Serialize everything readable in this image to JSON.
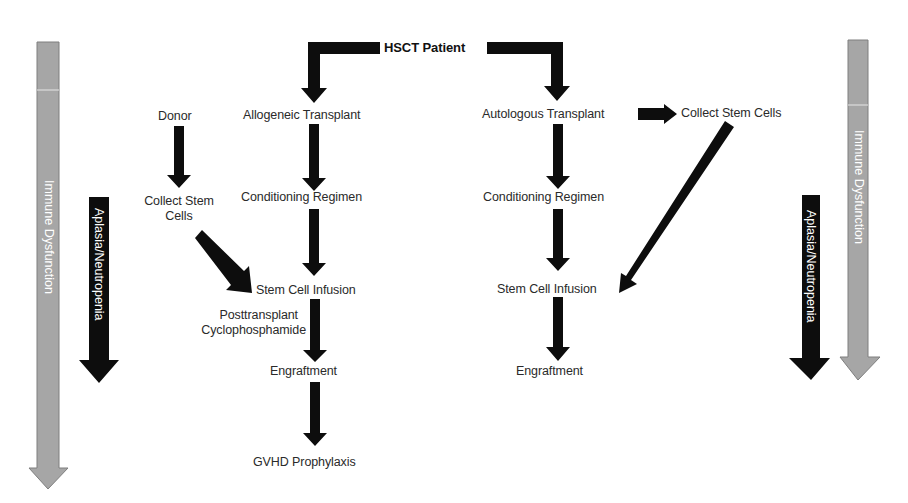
{
  "title": "HSCT Patient",
  "colors": {
    "arrow_black": "#0d0d0d",
    "arrow_gray": "#a6a6a6",
    "arrow_gray_border": "#7f7f7f",
    "text_on_black": "#ffffff",
    "text_on_gray": "#ffffff",
    "background": "#ffffff"
  },
  "allogeneic": {
    "branch": "Allogeneic Transplant",
    "steps": [
      "Conditioning Regimen",
      "Stem Cell Infusion",
      "Engraftment",
      "GVHD Prophylaxis"
    ],
    "donor": "Donor",
    "collect_line1": "Collect Stem",
    "collect_line2": "Cells",
    "ptcy_line1": "Posttransplant",
    "ptcy_line2": "Cyclophosphamide"
  },
  "autologous": {
    "branch": "Autologous Transplant",
    "collect": "Collect Stem Cells",
    "steps": [
      "Conditioning Regimen",
      "Stem Cell Infusion",
      "Engraftment"
    ]
  },
  "side_arrows": {
    "immune": "Immune Dysfunction",
    "aplasia": "Aplasia/Neutropenia"
  }
}
